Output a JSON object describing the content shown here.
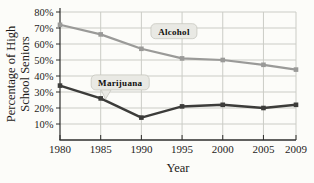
{
  "chart_data": {
    "type": "line",
    "title": "",
    "xlabel": "Year",
    "ylabel": "Percentage of High School Seniors",
    "ylabel_lines": [
      "Percentage of High",
      "School Seniors"
    ],
    "x": [
      1980,
      1985,
      1990,
      1995,
      2000,
      2005,
      2009
    ],
    "xtick_labels": [
      "1980",
      "1985",
      "1990",
      "1995",
      "2000",
      "2005",
      "2009"
    ],
    "xlim": [
      1980,
      2009
    ],
    "ylim": [
      0,
      80
    ],
    "yticks": [
      10,
      20,
      30,
      40,
      50,
      60,
      70,
      80
    ],
    "ytick_suffix": "%",
    "grid": true,
    "legend_position": "inline-callouts",
    "series": [
      {
        "name": "Alcohol",
        "values": [
          72,
          66,
          57,
          51,
          50,
          47,
          44
        ],
        "color": "#9a9a98",
        "line_width": 2.2
      },
      {
        "name": "Marijuana",
        "values": [
          34,
          26,
          14,
          21,
          22,
          20,
          22
        ],
        "color": "#3c3c3a",
        "line_width": 2.5
      }
    ],
    "annotations": [
      {
        "text": "Alcohol",
        "x": 1994.0,
        "y": 68,
        "box_w": 46,
        "box_h": 15,
        "tail": null
      },
      {
        "text": "Marijuana",
        "x": 1987.4,
        "y": 36,
        "box_w": 58,
        "box_h": 15,
        "tail": {
          "x": 1985.6,
          "y": 25.5
        }
      }
    ],
    "colors": {
      "paper": "#fcfcf9",
      "grid": "#cbccc6",
      "axis": "#2e2e2c",
      "tick_text": "#1f1d1b",
      "callout_bg": "#e9e9e4",
      "callout_border": "#c6c6bf",
      "callout_text": "#0e0e0c"
    }
  }
}
